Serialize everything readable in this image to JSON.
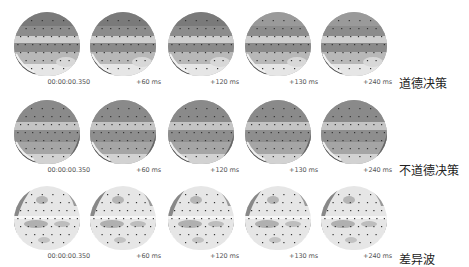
{
  "figure": {
    "time_labels": [
      "00:00:00.350",
      "+60 ms",
      "+120 ms",
      "+130 ms",
      "+240 ms"
    ],
    "rows": [
      {
        "label": "道德决策",
        "condition": "moral",
        "shading": "banded-dark"
      },
      {
        "label": "不道德决策",
        "condition": "immoral",
        "shading": "banded-dark"
      },
      {
        "label": "差异波",
        "condition": "difference",
        "shading": "light-patchy"
      }
    ]
  },
  "colors": {
    "scalp_dark": "#7a7a7a",
    "scalp_mid": "#a8a8a8",
    "scalp_light": "#e6e6e6",
    "electrode": "#333333",
    "label_text": "#555555"
  }
}
